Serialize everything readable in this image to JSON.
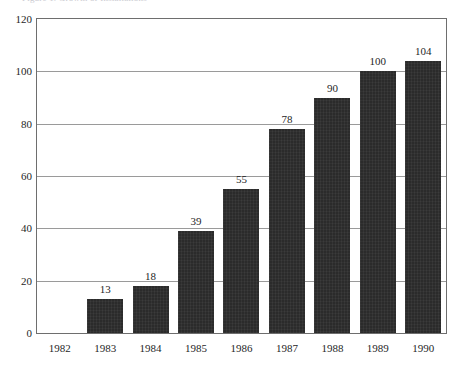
{
  "clipped_title": "Figure 1. Growth of Installations",
  "chart_data": {
    "type": "bar",
    "title": "",
    "xlabel": "",
    "ylabel": "",
    "categories": [
      "1982",
      "1983",
      "1984",
      "1985",
      "1986",
      "1987",
      "1988",
      "1989",
      "1990"
    ],
    "values": [
      0,
      13,
      18,
      39,
      55,
      78,
      90,
      100,
      104
    ],
    "value_labels": [
      "",
      "13",
      "18",
      "39",
      "55",
      "78",
      "90",
      "100",
      "104"
    ],
    "ylim": [
      0,
      120
    ],
    "yticks": [
      0,
      20,
      40,
      60,
      80,
      100,
      120
    ],
    "ytick_labels": [
      "0",
      "20",
      "40",
      "60",
      "80",
      "100",
      "120"
    ],
    "grid": true,
    "grid_axis": "y",
    "legend": false,
    "bar_color": "#2b2b2b",
    "grid_color": "#9a9a9a",
    "frame_color": "#6e6e6e",
    "background_color": "#ffffff"
  }
}
